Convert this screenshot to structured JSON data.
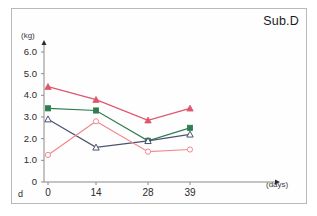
{
  "figure": {
    "title": "Sub.D",
    "corner_mark": "d",
    "background_color": "#ffffff",
    "frame_color": "#b9b9b9"
  },
  "axes": {
    "y_unit_label": "(kg)",
    "x_unit_label": "(days)",
    "y_ticks": [
      "0",
      "1.0",
      "2.0",
      "3.0",
      "4.0",
      "5.0",
      "6.0"
    ],
    "x_ticks": [
      "0",
      "14",
      "28",
      "39"
    ]
  },
  "chart_data": {
    "type": "line",
    "title": "Sub.D",
    "xlabel": "(days)",
    "ylabel": "(kg)",
    "x": [
      0,
      14,
      28,
      39
    ],
    "categories": [
      "0",
      "14",
      "28",
      "39"
    ],
    "xlim": [
      0,
      100
    ],
    "ylim": [
      0,
      6.0
    ],
    "y_tick_values": [
      0,
      1.0,
      2.0,
      3.0,
      4.0,
      5.0,
      6.0
    ],
    "grid": false,
    "legend": "none",
    "series": [
      {
        "name": "series-red-filled-triangle",
        "color": "#e0556b",
        "marker": "filled-triangle",
        "values": [
          4.4,
          3.8,
          2.85,
          3.4
        ]
      },
      {
        "name": "series-green-filled-square",
        "color": "#2e7d4f",
        "marker": "filled-square",
        "values": [
          3.4,
          3.3,
          1.9,
          2.5
        ]
      },
      {
        "name": "series-navy-open-triangle",
        "color": "#4a5270",
        "marker": "open-triangle",
        "values": [
          2.9,
          1.6,
          1.9,
          2.2
        ]
      },
      {
        "name": "series-pink-open-circle",
        "color": "#f08a8f",
        "marker": "open-circle",
        "values": [
          1.25,
          2.8,
          1.4,
          1.5
        ]
      }
    ]
  }
}
